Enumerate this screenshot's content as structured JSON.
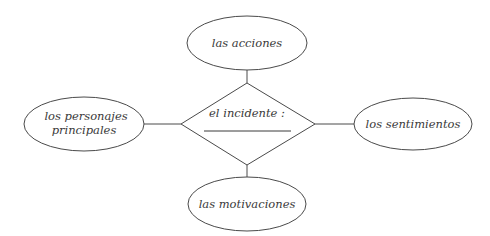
{
  "diagram": {
    "center": {
      "shape": "diamond",
      "label": "el incidente :",
      "blank_answer_line": true
    },
    "nodes": {
      "top": {
        "shape": "ellipse",
        "label": "las acciones"
      },
      "left": {
        "shape": "ellipse",
        "label_line1": "los personajes",
        "label_line2": "principales"
      },
      "right": {
        "shape": "ellipse",
        "label": "los sentimientos"
      },
      "bottom": {
        "shape": "ellipse",
        "label": "las motivaciones"
      }
    },
    "connections": [
      {
        "from": "center",
        "to": "top"
      },
      {
        "from": "center",
        "to": "left"
      },
      {
        "from": "center",
        "to": "right"
      },
      {
        "from": "center",
        "to": "bottom"
      }
    ],
    "colors": {
      "stroke": "#4a4a4a",
      "text": "#3a3a3a",
      "background": "#ffffff"
    }
  }
}
